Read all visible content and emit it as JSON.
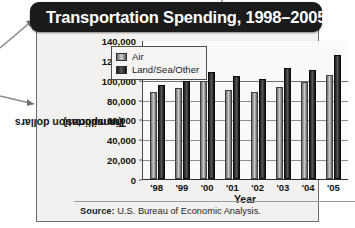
{
  "figure": {
    "title": "Transportation Spending, 1998–2005",
    "source_label": "Source:",
    "source_text": "U.S. Bureau of Economic Analysis."
  },
  "legend": {
    "items": [
      {
        "label": "Air",
        "key": "air",
        "color": "#9d9d9d"
      },
      {
        "label": "Land/Sea/Other",
        "key": "land",
        "color": "#1c1c1c"
      }
    ]
  },
  "axes": {
    "ylabel_line1": "Transportation dollars",
    "ylabel_line2": "(in millions)",
    "xlabel": "Year",
    "yticks": [
      "140,000",
      "120,000",
      "100,000",
      "80,000",
      "60,000",
      "40,000",
      "20,000",
      "0"
    ],
    "xticks": [
      "'98",
      "'99",
      "'00",
      "'01",
      "'02",
      "'03",
      "'04",
      "'05"
    ]
  },
  "chart_data": {
    "type": "bar",
    "title": "Transportation Spending, 1998–2005",
    "subtitle": "",
    "xlabel": "Year",
    "ylabel": "Transportation dollars (in millions)",
    "ylim": [
      0,
      140000
    ],
    "ytick_step": 20000,
    "grid": true,
    "legend_position": "top-left-inside",
    "categories": [
      "'98",
      "'99",
      "'00",
      "'01",
      "'02",
      "'03",
      "'04",
      "'05"
    ],
    "series": [
      {
        "name": "Air",
        "values": [
          88000,
          92000,
          99000,
          90000,
          88000,
          93000,
          98000,
          105000
        ]
      },
      {
        "name": "Land/Sea/Other",
        "values": [
          95000,
          99000,
          108000,
          104000,
          101000,
          112000,
          110000,
          125000
        ]
      }
    ],
    "source": "Source: U.S. Bureau of Economic Analysis."
  }
}
